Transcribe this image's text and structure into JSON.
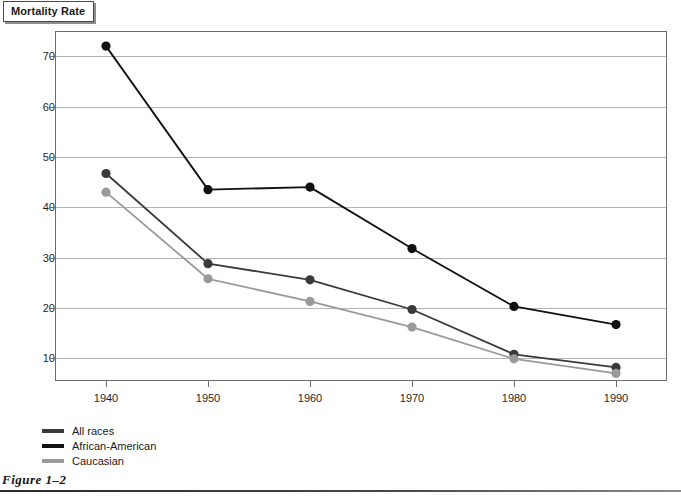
{
  "title": "Mortality Rate",
  "caption": "Figure 1–2",
  "chart_data": {
    "type": "line",
    "title": "Mortality Rate",
    "xlabel": "",
    "ylabel": "Mortality Rate",
    "categories": [
      "1940",
      "1950",
      "1960",
      "1970",
      "1980",
      "1990"
    ],
    "x": [
      1940,
      1950,
      1960,
      1970,
      1980,
      1990
    ],
    "xlim": [
      1935,
      1995
    ],
    "ylim": [
      5.5,
      75
    ],
    "yticks": [
      10,
      20,
      30,
      40,
      50,
      60,
      70
    ],
    "ytick_labels": [
      "10",
      "20",
      "30",
      "40",
      "50",
      "60",
      "70"
    ],
    "grid": true,
    "legend_position": "below-left",
    "markers": "filled-circle",
    "series": [
      {
        "name": "All races",
        "color": "#3a3a3a",
        "values": [
          46.7,
          28.8,
          25.6,
          19.7,
          10.8,
          8.2
        ]
      },
      {
        "name": "African-American",
        "color": "#111111",
        "values": [
          72.0,
          43.5,
          44.0,
          31.8,
          20.3,
          16.7
        ]
      },
      {
        "name": "Caucasian",
        "color": "#9a9a9a",
        "values": [
          43.0,
          25.8,
          21.3,
          16.2,
          9.9,
          7.0
        ]
      }
    ]
  },
  "legend": [
    {
      "label": "All races",
      "color": "#3a3a3a"
    },
    {
      "label": "African-American",
      "color": "#111111"
    },
    {
      "label": "Caucasian",
      "color": "#9a9a9a"
    }
  ]
}
